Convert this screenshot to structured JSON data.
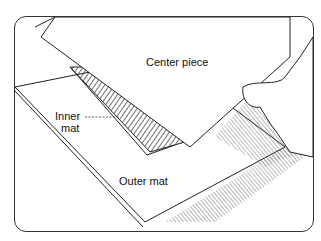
{
  "illustration": {
    "labels": {
      "center_piece": "Center piece",
      "inner_mat_line1": "Inner",
      "inner_mat_line2": "mat",
      "outer_mat": "Outer mat"
    }
  }
}
